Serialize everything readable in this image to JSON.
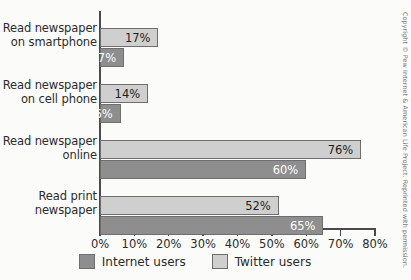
{
  "chart_data": {
    "type": "bar",
    "orientation": "horizontal",
    "title": "",
    "xlabel": "",
    "ylabel": "",
    "xlim": [
      0,
      80
    ],
    "xticks": [
      "0%",
      "10%",
      "20%",
      "30%",
      "40%",
      "50%",
      "60%",
      "70%",
      "80%"
    ],
    "xtick_values": [
      0,
      10,
      20,
      30,
      40,
      50,
      60,
      70,
      80
    ],
    "grid": false,
    "legend_position": "bottom",
    "categories": [
      "Read newspaper\non smartphone",
      "Read newspaper\non cell phone",
      "Read newspaper\nonline",
      "Read print\nnewspaper"
    ],
    "series": [
      {
        "name": "Twitter users",
        "color": "#cfcfcf",
        "values": [
          17,
          14,
          76,
          52
        ],
        "labels": [
          "17%",
          "14%",
          "76%",
          "52%"
        ]
      },
      {
        "name": "Internet users",
        "color": "#8e8e8e",
        "values": [
          7,
          6,
          60,
          65
        ],
        "labels": [
          "7%",
          "6%",
          "60%",
          "65%"
        ]
      }
    ]
  },
  "legend": {
    "items": [
      {
        "label": "Internet users",
        "swatch": "dark"
      },
      {
        "label": "Twitter users",
        "swatch": "light"
      }
    ]
  },
  "footer": {
    "copyright": "Copyright © Pew Internet & American Life Project. Reprinted with permission."
  }
}
